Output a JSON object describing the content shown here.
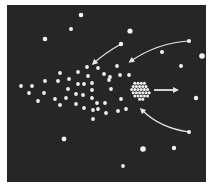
{
  "diagram": {
    "title": "",
    "colors": {
      "background": "#ffffff",
      "panel": "#262626",
      "dot": "#f2f2f2",
      "arrow": "#e6e6e6"
    },
    "panel": {
      "x": 7,
      "y": 5,
      "width": 199,
      "height": 177
    },
    "isolated_stars": [
      {
        "x": 81,
        "y": 15,
        "r": 2.3
      },
      {
        "x": 71,
        "y": 29,
        "r": 2
      },
      {
        "x": 45,
        "y": 39,
        "r": 2.3
      },
      {
        "x": 130,
        "y": 31,
        "r": 2.6
      },
      {
        "x": 189,
        "y": 41,
        "r": 2
      },
      {
        "x": 162,
        "y": 52,
        "r": 2
      },
      {
        "x": 202,
        "y": 56,
        "r": 2.8
      },
      {
        "x": 181,
        "y": 66,
        "r": 2
      },
      {
        "x": 196,
        "y": 98,
        "r": 2.2
      },
      {
        "x": 64,
        "y": 139,
        "r": 2.4
      },
      {
        "x": 143,
        "y": 149,
        "r": 2.8
      },
      {
        "x": 174,
        "y": 148,
        "r": 2.2
      },
      {
        "x": 123,
        "y": 166,
        "r": 1.9
      },
      {
        "x": 189,
        "y": 132,
        "r": 2
      },
      {
        "x": 121,
        "y": 44,
        "r": 2.2
      }
    ],
    "scattered_group": [
      {
        "x": 21,
        "y": 86
      },
      {
        "x": 32,
        "y": 86
      },
      {
        "x": 29,
        "y": 93
      },
      {
        "x": 38,
        "y": 101
      },
      {
        "x": 45,
        "y": 81
      },
      {
        "x": 44,
        "y": 93
      },
      {
        "x": 55,
        "y": 99
      },
      {
        "x": 60,
        "y": 105
      },
      {
        "x": 58,
        "y": 81
      },
      {
        "x": 60,
        "y": 73
      },
      {
        "x": 69,
        "y": 79
      },
      {
        "x": 68,
        "y": 89
      },
      {
        "x": 66,
        "y": 98
      },
      {
        "x": 78,
        "y": 72
      },
      {
        "x": 78,
        "y": 84
      },
      {
        "x": 76,
        "y": 94
      },
      {
        "x": 76,
        "y": 104
      },
      {
        "x": 84,
        "y": 84
      },
      {
        "x": 83,
        "y": 95
      },
      {
        "x": 84,
        "y": 108
      },
      {
        "x": 87,
        "y": 67
      },
      {
        "x": 88,
        "y": 76
      },
      {
        "x": 92,
        "y": 83
      },
      {
        "x": 92,
        "y": 90
      },
      {
        "x": 92,
        "y": 98
      },
      {
        "x": 93,
        "y": 110
      },
      {
        "x": 98,
        "y": 68
      },
      {
        "x": 97,
        "y": 103
      },
      {
        "x": 98,
        "y": 109
      },
      {
        "x": 104,
        "y": 74
      },
      {
        "x": 109,
        "y": 80
      },
      {
        "x": 105,
        "y": 103
      },
      {
        "x": 106,
        "y": 113
      },
      {
        "x": 110,
        "y": 77
      },
      {
        "x": 111,
        "y": 89
      },
      {
        "x": 117,
        "y": 66
      },
      {
        "x": 120,
        "y": 75
      },
      {
        "x": 121,
        "y": 99
      },
      {
        "x": 118,
        "y": 111
      },
      {
        "x": 126,
        "y": 109
      },
      {
        "x": 129,
        "y": 75
      },
      {
        "x": 93,
        "y": 119
      }
    ],
    "dense_cluster": {
      "cx": 140,
      "cy": 90,
      "radius": 10,
      "dot_r": 1.5
    },
    "arrows": [
      {
        "name": "incoming-arrow-top-left",
        "path": "M121,44 Q105,53 94,63",
        "head": [
          94,
          63
        ]
      },
      {
        "name": "incoming-arrow-top-right",
        "path": "M189,41 Q157,43 131,61",
        "head": [
          131,
          61
        ]
      },
      {
        "name": "incoming-arrow-bottom",
        "path": "M189,132 Q160,128 142,110",
        "head": [
          142,
          110
        ]
      },
      {
        "name": "outgoing-arrow-right",
        "path": "M154,90 L172,90",
        "head": [
          178,
          90
        ]
      }
    ]
  }
}
